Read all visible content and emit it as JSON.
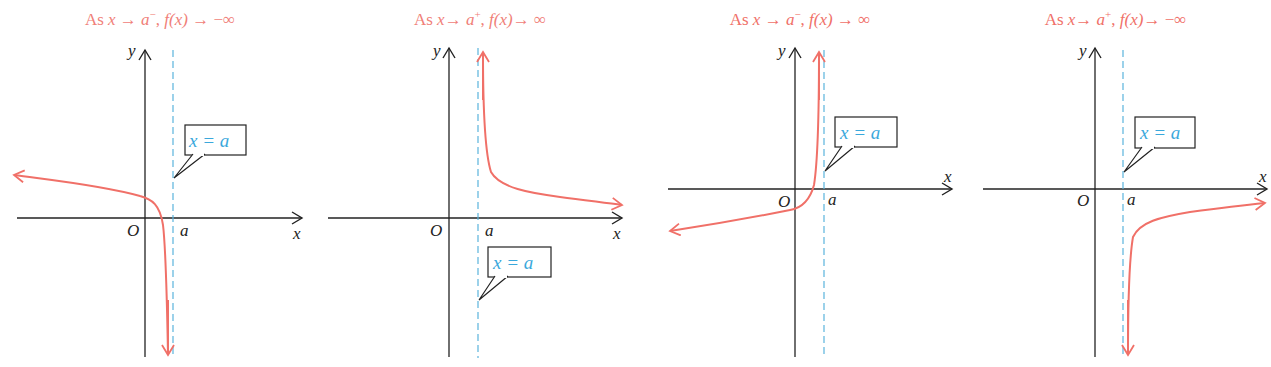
{
  "colors": {
    "curve": "#f07068",
    "title": "#f08078",
    "asymptote": "#5ab4dc",
    "callout_text": "#3aa8dc",
    "axis": "#222222"
  },
  "labels": {
    "origin": "O",
    "x_axis": "x",
    "y_axis": "y",
    "asymptote_tick": "a",
    "callout": "x = a"
  },
  "panels": [
    {
      "title": {
        "prefix": "As ",
        "var": "x",
        "arrow1": " → ",
        "limit": "a",
        "side": "−",
        "mid": ", ",
        "fx": "f(x)",
        "arrow2": " → ",
        "result": "−∞"
      },
      "behavior": "x→a⁻, f(x)→−∞"
    },
    {
      "title": {
        "prefix": "As ",
        "var": "x",
        "arrow1": "→  ",
        "limit": "a",
        "side": "+",
        "mid": ", ",
        "fx": "f(x)",
        "arrow2": "→ ",
        "result": "∞"
      },
      "behavior": "x→a⁺, f(x)→∞"
    },
    {
      "title": {
        "prefix": "As ",
        "var": "x",
        "arrow1": " → ",
        "limit": "a",
        "side": "−",
        "mid": ", ",
        "fx": "f(x)",
        "arrow2": " → ",
        "result": "∞"
      },
      "behavior": "x→a⁻, f(x)→∞"
    },
    {
      "title": {
        "prefix": "As ",
        "var": "x",
        "arrow1": "→  ",
        "limit": "a",
        "side": "+",
        "mid": ", ",
        "fx": "f(x)",
        "arrow2": "→ ",
        "result": "−∞"
      },
      "behavior": "x→a⁺, f(x)→−∞"
    }
  ]
}
